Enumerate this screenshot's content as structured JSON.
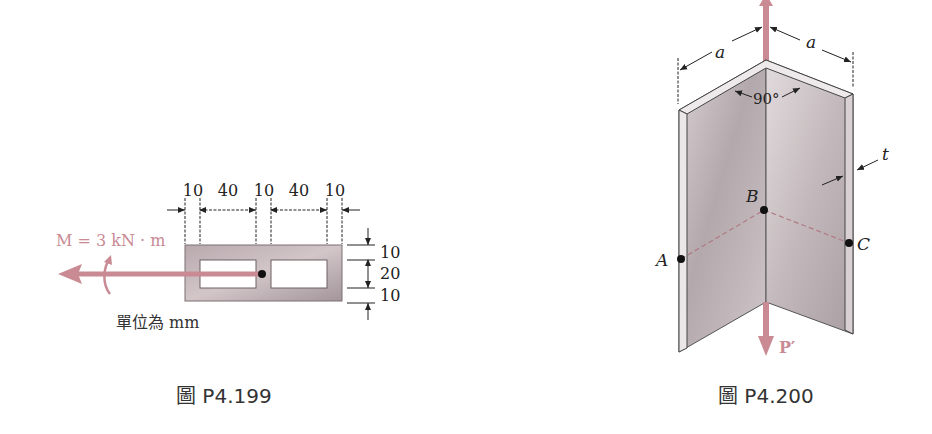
{
  "figures": [
    {
      "id": "P4.199",
      "caption": "圖 P4.199",
      "moment_label": "M = 3 kN · m",
      "units_label": "單位為 mm",
      "horizontal_dims": [
        "10",
        "40",
        "10",
        "40",
        "10"
      ],
      "vertical_dims": [
        "10",
        "20",
        "10"
      ]
    },
    {
      "id": "P4.200",
      "caption": "圖 P4.200",
      "dim_a_left": "a",
      "dim_a_right": "a",
      "angle_label": "90°",
      "thickness_label": "t",
      "point_a": "A",
      "point_b": "B",
      "point_c": "C",
      "force_label": "P′"
    }
  ],
  "colors": {
    "load_arrow": "#c98a93",
    "section_fill": "#a89a9e",
    "angle_fill": "#c8bfc3",
    "dim_line": "#222222"
  }
}
